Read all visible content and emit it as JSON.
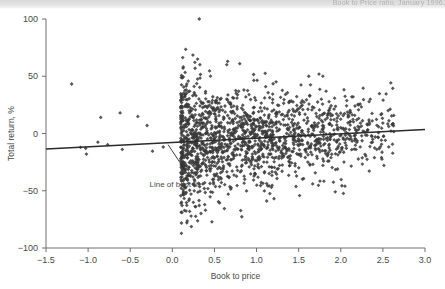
{
  "figure": {
    "caption_fragment": "Book to Price ratio, January 1996.",
    "background_color": "#ffffff",
    "marker_color": "#3a3a3a",
    "axis_color": "#6e6e6e",
    "fit_line_color": "#2b2b2b"
  },
  "chart_data": {
    "type": "scatter",
    "title": "",
    "xlabel": "Book to price",
    "ylabel": "Total return, %",
    "xlim": [
      -1.5,
      3.0
    ],
    "ylim": [
      -100,
      100
    ],
    "xticks": [
      -1.5,
      -1.0,
      -0.5,
      0.0,
      0.5,
      1.0,
      1.5,
      2.0,
      2.5,
      3.0
    ],
    "xtick_labels": [
      "−1.5",
      "−1.0",
      "−0.5",
      "0.0",
      "0.5",
      "1.0",
      "1.5",
      "2.0",
      "2.5",
      "3.0"
    ],
    "yticks": [
      -100,
      -50,
      0,
      50,
      100
    ],
    "ytick_labels": [
      "−100",
      "−50",
      "0",
      "50",
      "100"
    ],
    "grid": false,
    "legend": null,
    "marker": "diamond",
    "marker_size": 3,
    "annotations": [
      {
        "text": "Line of best fit",
        "text_x": 0.18,
        "text_y": -44,
        "arrow_to_x": -0.05,
        "arrow_to_y": -8
      }
    ],
    "fit_line": {
      "name": "Line of best fit",
      "x": [
        -1.5,
        3.0
      ],
      "y": [
        -13.5,
        3.5
      ],
      "slope": 3.78,
      "intercept": -7.83
    },
    "series": [
      {
        "name": "Stocks",
        "n_points": 1850,
        "description": "Dense cloud centred on small positive returns, concentrated between book-to-price 0.05 and 2.6, thinning toward the right; a handful of sparse outliers at negative book-to-price values and a few high-return outliers near 100%.",
        "outliers": [
          {
            "x": 0.32,
            "y": 100
          },
          {
            "x": 0.3,
            "y": 65
          },
          {
            "x": 0.27,
            "y": 57
          },
          {
            "x": -0.62,
            "y": 18
          },
          {
            "x": -0.85,
            "y": 14
          },
          {
            "x": -1.02,
            "y": -18
          },
          {
            "x": -0.3,
            "y": 7
          },
          {
            "x": 2.05,
            "y": -46
          },
          {
            "x": 1.62,
            "y": 50
          },
          {
            "x": 2.35,
            "y": 30
          }
        ]
      }
    ]
  }
}
